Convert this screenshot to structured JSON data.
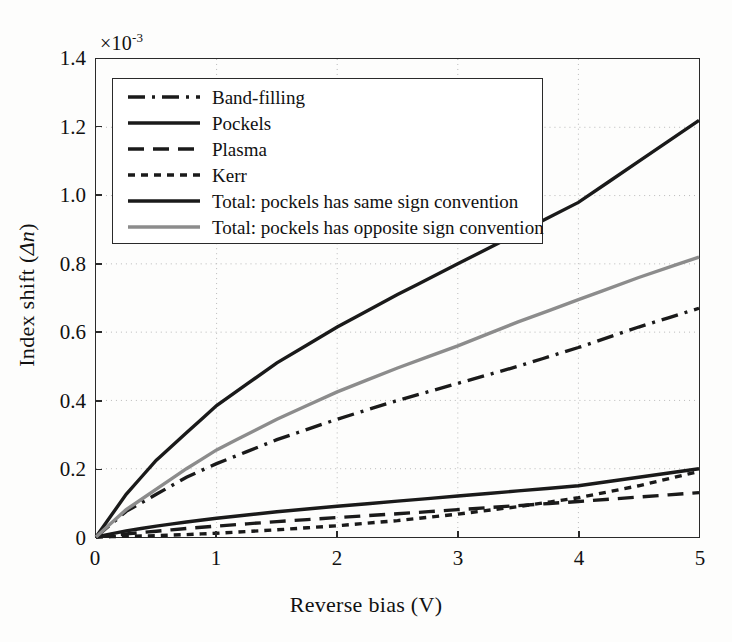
{
  "chart_data": {
    "type": "line",
    "title": "",
    "xlabel": "Reverse bias (V)",
    "ylabel": "Index shift (Δn)",
    "y_multiplier": "×10",
    "y_multiplier_exponent": "-3",
    "xlim": [
      0,
      5
    ],
    "ylim": [
      0,
      1.4
    ],
    "xticks": [
      "0",
      "1",
      "2",
      "3",
      "4",
      "5"
    ],
    "yticks": [
      "0",
      "0.2",
      "0.4",
      "0.6",
      "0.8",
      "1.0",
      "1.2",
      "1.4"
    ],
    "grid": "dotted",
    "legend_position": "upper-left-inside",
    "x": [
      0,
      0.25,
      0.5,
      0.75,
      1,
      1.5,
      2,
      2.5,
      3,
      3.5,
      4,
      4.5,
      5
    ],
    "series": [
      {
        "name": "Band-filling",
        "style": "dash-dot",
        "color": "#1a1a1a",
        "values": [
          0,
          0.075,
          0.125,
          0.175,
          0.215,
          0.285,
          0.345,
          0.4,
          0.45,
          0.5,
          0.555,
          0.615,
          0.67
        ]
      },
      {
        "name": "Pockels",
        "style": "solid",
        "color": "#1a1a1a",
        "values": [
          0,
          0.018,
          0.032,
          0.044,
          0.055,
          0.074,
          0.09,
          0.105,
          0.12,
          0.135,
          0.15,
          0.175,
          0.2
        ]
      },
      {
        "name": "Plasma",
        "style": "dashed",
        "color": "#1a1a1a",
        "values": [
          0,
          0.009,
          0.017,
          0.025,
          0.032,
          0.045,
          0.057,
          0.068,
          0.08,
          0.092,
          0.104,
          0.117,
          0.13
        ]
      },
      {
        "name": "Kerr",
        "style": "dotted",
        "color": "#1a1a1a",
        "values": [
          0,
          0.002,
          0.004,
          0.007,
          0.011,
          0.021,
          0.033,
          0.048,
          0.067,
          0.089,
          0.115,
          0.15,
          0.192
        ]
      },
      {
        "name": "Total: pockels has same sign convention",
        "style": "solid",
        "color": "#1a1a1a",
        "values": [
          0,
          0.125,
          0.225,
          0.305,
          0.385,
          0.51,
          0.615,
          0.71,
          0.8,
          0.89,
          0.98,
          1.1,
          1.22
        ]
      },
      {
        "name": "Total: pockels has opposite sign convention",
        "style": "solid",
        "color": "#8c8c8c",
        "values": [
          0,
          0.08,
          0.14,
          0.2,
          0.255,
          0.345,
          0.425,
          0.495,
          0.56,
          0.63,
          0.695,
          0.76,
          0.82
        ]
      }
    ]
  },
  "axes": {
    "x_title": "Reverse bias (V)",
    "y_title_prefix": "Index shift (",
    "y_title_symbol": "Δn",
    "y_title_suffix": ")",
    "exponent_base": "×10",
    "exponent_power": "-3",
    "xticks": [
      "0",
      "1",
      "2",
      "3",
      "4",
      "5"
    ],
    "yticks": [
      "0",
      "0.2",
      "0.4",
      "0.6",
      "0.8",
      "1.0",
      "1.2",
      "1.4"
    ]
  },
  "legend": {
    "items": [
      {
        "label": "Band-filling",
        "style": "dash-dot",
        "color": "#1a1a1a"
      },
      {
        "label": "Pockels",
        "style": "solid",
        "color": "#1a1a1a"
      },
      {
        "label": "Plasma",
        "style": "dashed",
        "color": "#1a1a1a"
      },
      {
        "label": "Kerr",
        "style": "dotted",
        "color": "#1a1a1a"
      },
      {
        "label": "Total: pockels has same sign convention",
        "style": "solid",
        "color": "#1a1a1a"
      },
      {
        "label": "Total: pockels has opposite sign convention",
        "style": "solid",
        "color": "#8c8c8c"
      }
    ]
  }
}
